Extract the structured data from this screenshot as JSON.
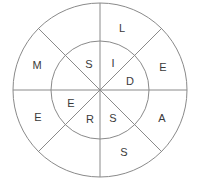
{
  "figure": {
    "background_color": "#ffffff",
    "stroke_color": "#8a8a8a",
    "letter_color": "#3a3a3a",
    "center": {
      "x": 100,
      "y": 90
    },
    "outer_radius": 87,
    "inner_radius": 49
  },
  "outer_ring": {
    "name": "outer-ring",
    "letters": [
      {
        "id": "outer-top",
        "char": "L",
        "x": 122,
        "y": 29
      },
      {
        "id": "outer-upper-right",
        "char": "E",
        "x": 163,
        "y": 68
      },
      {
        "id": "outer-lower-right",
        "char": "A",
        "x": 162,
        "y": 119
      },
      {
        "id": "outer-bottom",
        "char": "S",
        "x": 124,
        "y": 153
      },
      {
        "id": "outer-lower-left",
        "char": "E",
        "x": 38,
        "y": 118
      },
      {
        "id": "outer-upper-left",
        "char": "M",
        "x": 37,
        "y": 66
      }
    ]
  },
  "inner_ring": {
    "name": "inner-ring",
    "letters": [
      {
        "id": "inner-upper-left",
        "char": "S",
        "x": 89,
        "y": 65
      },
      {
        "id": "inner-top",
        "char": "I",
        "x": 113,
        "y": 64
      },
      {
        "id": "inner-upper-right",
        "char": "D",
        "x": 130,
        "y": 82
      },
      {
        "id": "inner-lower-right",
        "char": "S",
        "x": 113,
        "y": 119
      },
      {
        "id": "inner-bottom",
        "char": "R",
        "x": 90,
        "y": 120
      },
      {
        "id": "inner-left",
        "char": "E",
        "x": 71,
        "y": 104
      }
    ]
  },
  "dividers": [
    {
      "id": "divider-horizontal",
      "x1": 13,
      "y1": 90,
      "x2": 187,
      "y2": 90
    },
    {
      "id": "divider-vertical",
      "x1": 100,
      "y1": 3,
      "x2": 100,
      "y2": 177
    },
    {
      "id": "divider-diagonal-nw",
      "x1": 38,
      "y1": 28,
      "x2": 162,
      "y2": 152
    },
    {
      "id": "divider-diagonal-ne",
      "x1": 162,
      "y1": 28,
      "x2": 38,
      "y2": 152
    }
  ]
}
